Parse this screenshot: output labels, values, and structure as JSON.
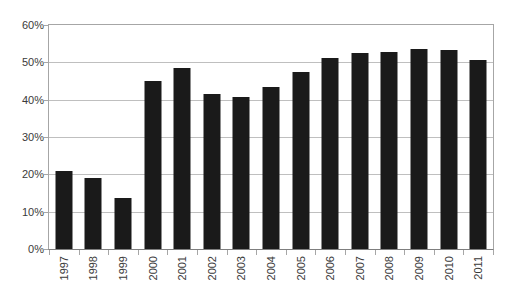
{
  "chart_data": {
    "type": "bar",
    "title": "",
    "subtitle": "",
    "xlabel": "",
    "ylabel": "",
    "categories": [
      "1997",
      "1998",
      "1999",
      "2000",
      "2001",
      "2002",
      "2003",
      "2004",
      "2005",
      "2006",
      "2007",
      "2008",
      "2009",
      "2010",
      "2011"
    ],
    "values": [
      20.9,
      19.0,
      13.6,
      45.0,
      48.5,
      41.5,
      40.8,
      43.5,
      47.5,
      51.1,
      52.4,
      52.9,
      53.6,
      53.3,
      50.6
    ],
    "value_suffix": "%",
    "ylim": [
      0,
      60
    ],
    "ytick_values": [
      0,
      10,
      20,
      30,
      40,
      50,
      60
    ],
    "ytick_labels": [
      "0%",
      "10%",
      "20%",
      "30%",
      "40%",
      "50%",
      "60%"
    ],
    "grid": true,
    "grid_axis": "y",
    "legend": false,
    "legend_position": "none",
    "series": [
      {
        "name": "",
        "values": [
          20.9,
          19.0,
          13.6,
          45.0,
          48.5,
          41.5,
          40.8,
          43.5,
          47.5,
          51.1,
          52.4,
          52.9,
          53.6,
          53.3,
          50.6
        ]
      }
    ],
    "annotations": []
  },
  "style": {
    "bar_color": "#1a1a1a",
    "grid_color": "#bfbfbf",
    "axis_color": "#a6a6a6",
    "baseline_color": "#7f7f7f",
    "text_color": "#3a3a3a",
    "background": "#ffffff"
  }
}
